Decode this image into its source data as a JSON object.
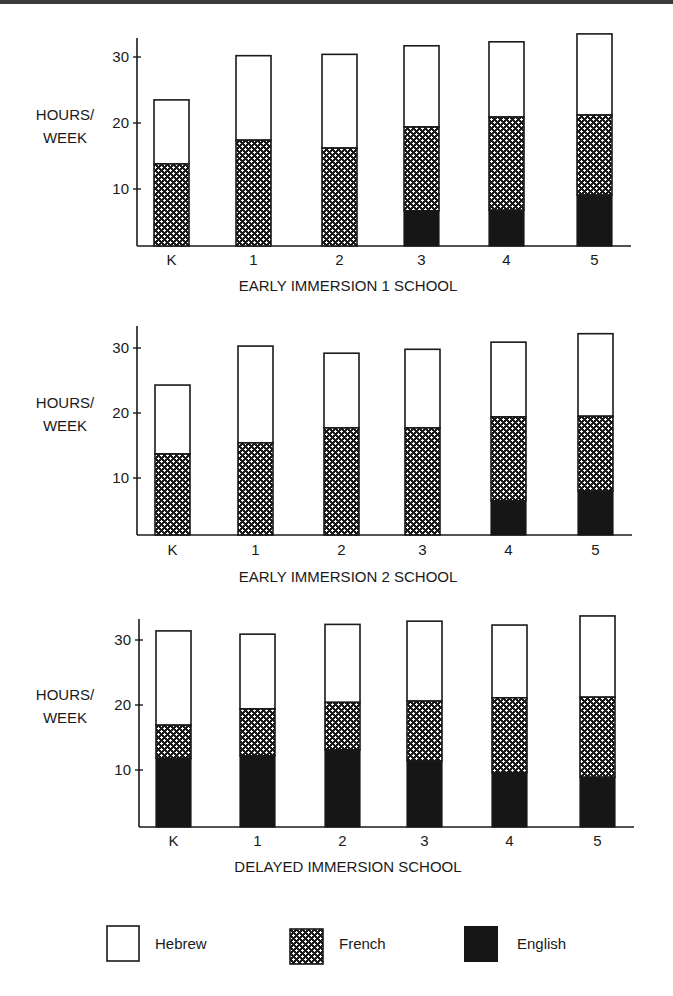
{
  "colors": {
    "hebrew_fill": "#ffffff",
    "french_bg": "#1a1a1a",
    "french_fg": "#ffffff",
    "english_fill": "#161616",
    "stroke": "#1a1a1a",
    "top_rule": "#3a3a3a"
  },
  "legend": {
    "items": [
      {
        "key": "hebrew",
        "label": "Hebrew",
        "pattern": "white"
      },
      {
        "key": "french",
        "label": "French",
        "pattern": "crosshatch"
      },
      {
        "key": "english",
        "label": "English",
        "pattern": "solid-black"
      }
    ]
  },
  "chart_data": [
    {
      "type": "bar",
      "stacked": true,
      "title": "EARLY IMMERSION 1 SCHOOL",
      "xlabel": "EARLY IMMERSION 1 SCHOOL",
      "ylabel": "HOURS/ WEEK",
      "ylabel_lines": [
        "HOURS/",
        "WEEK"
      ],
      "categories": [
        "K",
        "1",
        "2",
        "3",
        "4",
        "5"
      ],
      "yticks": [
        10,
        20,
        30
      ],
      "ylim": [
        0,
        35
      ],
      "grid": false,
      "legend_position": "bottom",
      "series": [
        {
          "name": "English",
          "values": [
            0,
            0,
            0,
            6.7,
            6.8,
            9.1
          ]
        },
        {
          "name": "French",
          "values": [
            13.8,
            17.4,
            16.2,
            12.7,
            14.1,
            12.1
          ]
        },
        {
          "name": "Hebrew",
          "values": [
            9.7,
            12.8,
            14.2,
            12.3,
            11.4,
            12.3
          ]
        }
      ],
      "totals": [
        23.5,
        30.2,
        30.4,
        31.7,
        32.3,
        33.5
      ],
      "cumulative_tops": {
        "english": [
          0,
          0,
          0,
          6.7,
          6.8,
          9.1
        ],
        "french": [
          13.8,
          17.4,
          16.2,
          19.4,
          20.9,
          21.2
        ],
        "hebrew": [
          23.5,
          30.2,
          30.4,
          31.7,
          32.3,
          33.5
        ]
      }
    },
    {
      "type": "bar",
      "stacked": true,
      "title": "EARLY IMMERSION 2 SCHOOL",
      "xlabel": "EARLY IMMERSION 2 SCHOOL",
      "ylabel": "HOURS/ WEEK",
      "ylabel_lines": [
        "HOURS/",
        "WEEK"
      ],
      "categories": [
        "K",
        "1",
        "2",
        "3",
        "4",
        "5"
      ],
      "yticks": [
        10,
        20,
        30
      ],
      "ylim": [
        0,
        35
      ],
      "grid": false,
      "legend_position": "bottom",
      "series": [
        {
          "name": "English",
          "values": [
            0,
            0,
            0,
            0,
            6.5,
            8.0
          ]
        },
        {
          "name": "French",
          "values": [
            13.7,
            15.4,
            17.7,
            17.7,
            12.9,
            11.5
          ]
        },
        {
          "name": "Hebrew",
          "values": [
            10.6,
            14.9,
            11.5,
            12.1,
            11.5,
            12.7
          ]
        }
      ],
      "totals": [
        24.3,
        30.3,
        29.2,
        29.8,
        30.9,
        32.2
      ],
      "cumulative_tops": {
        "english": [
          0,
          0,
          0,
          0,
          6.5,
          8.0
        ],
        "french": [
          13.7,
          15.4,
          17.7,
          17.7,
          19.4,
          19.5
        ],
        "hebrew": [
          24.3,
          30.3,
          29.2,
          29.8,
          30.9,
          32.2
        ]
      }
    },
    {
      "type": "bar",
      "stacked": true,
      "title": "DELAYED IMMERSION SCHOOL",
      "xlabel": "DELAYED IMMERSION SCHOOL",
      "ylabel": "HOURS/ WEEK",
      "ylabel_lines": [
        "HOURS/",
        "WEEK"
      ],
      "categories": [
        "K",
        "1",
        "2",
        "3",
        "4",
        "5"
      ],
      "yticks": [
        10,
        20,
        30
      ],
      "ylim": [
        0,
        35
      ],
      "grid": false,
      "legend_position": "bottom",
      "series": [
        {
          "name": "English",
          "values": [
            11.8,
            12.2,
            13.1,
            11.4,
            9.6,
            8.9
          ]
        },
        {
          "name": "French",
          "values": [
            5.1,
            7.2,
            7.3,
            9.2,
            11.5,
            12.3
          ]
        },
        {
          "name": "Hebrew",
          "values": [
            14.5,
            11.5,
            12.0,
            12.3,
            11.2,
            12.5
          ]
        }
      ],
      "totals": [
        31.4,
        30.9,
        32.4,
        32.9,
        32.3,
        33.7
      ],
      "cumulative_tops": {
        "english": [
          11.8,
          12.2,
          13.1,
          11.4,
          9.6,
          8.9
        ],
        "french": [
          16.9,
          19.4,
          20.4,
          20.6,
          21.1,
          21.2
        ],
        "hebrew": [
          31.4,
          30.9,
          32.4,
          32.9,
          32.3,
          33.7
        ]
      }
    }
  ]
}
